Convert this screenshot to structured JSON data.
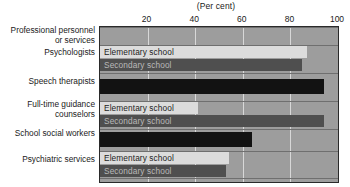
{
  "chart_data": {
    "type": "bar",
    "orientation": "horizontal",
    "title": "(Per cent)",
    "xlabel": "(Per cent)",
    "ylabel": "",
    "xlim": [
      0,
      100
    ],
    "xticks": [
      20,
      40,
      60,
      80,
      100
    ],
    "xtick_labels": [
      "20",
      "40",
      "60",
      "80",
      "100"
    ],
    "grid": true,
    "legend": "inline-bar-labels",
    "series_names": [
      "Elementary school",
      "Secondary school"
    ],
    "categories": [
      "Professional personnel\nor services",
      "Psychologists",
      "Speech therapists",
      "Full-time guidance\ncounselors",
      "School social workers",
      "Psychiatric services"
    ],
    "groups": [
      {
        "category": "Professional personnel\nor services",
        "is_header": true,
        "bars": []
      },
      {
        "category": "Psychologists",
        "is_header": false,
        "bars": [
          {
            "series": "Elementary school",
            "value": 87,
            "label": "Elementary school",
            "style": "elementary"
          },
          {
            "series": "Secondary school",
            "value": 85,
            "label": "Secondary school",
            "style": "secondary"
          }
        ]
      },
      {
        "category": "Speech therapists",
        "is_header": false,
        "bars": [
          {
            "series": "",
            "value": 94,
            "label": "",
            "style": "single"
          }
        ]
      },
      {
        "category": "Full-time guidance\ncounselors",
        "is_header": false,
        "bars": [
          {
            "series": "Elementary school",
            "value": 41,
            "label": "Elementary school",
            "style": "elementary"
          },
          {
            "series": "Secondary school",
            "value": 94,
            "label": "Secondary school",
            "style": "secondary"
          }
        ]
      },
      {
        "category": "School social workers",
        "is_header": false,
        "bars": [
          {
            "series": "",
            "value": 64,
            "label": "",
            "style": "single"
          }
        ]
      },
      {
        "category": "Psychiatric services",
        "is_header": false,
        "bars": [
          {
            "series": "Elementary school",
            "value": 54,
            "label": "Elementary school",
            "style": "elementary"
          },
          {
            "series": "Secondary school",
            "value": 53,
            "label": "Secondary school",
            "style": "secondary"
          }
        ]
      }
    ],
    "colors": {
      "elementary": "#dcdcdc",
      "secondary": "#4f4f4f",
      "single": "#121212",
      "plot_background": "#9d9d9d",
      "gridline": "#d8d8d8",
      "axis": "#2a2a2a",
      "text": "#1a1a1a"
    }
  },
  "layout": {
    "plot_left": 99,
    "plot_top": 26,
    "plot_width": 238,
    "plot_height": 155,
    "category_rows": [
      {
        "label": "Professional personnel\nor services",
        "label_top": 0,
        "band_top": 0,
        "band_height": 17
      },
      {
        "label": "Psychologists",
        "label_top": 22,
        "band_top": 18,
        "band_height": 27
      },
      {
        "label": "Speech therapists",
        "label_top": 51,
        "band_top": 46,
        "band_height": 27
      },
      {
        "label": "Full-time guidance\ncounselors",
        "label_top": 74,
        "band_top": 74,
        "band_height": 27
      },
      {
        "label": "School social workers",
        "label_top": 103,
        "band_top": 102,
        "band_height": 20
      },
      {
        "label": "Psychiatric services",
        "label_top": 129,
        "band_top": 124,
        "band_height": 27
      }
    ]
  }
}
